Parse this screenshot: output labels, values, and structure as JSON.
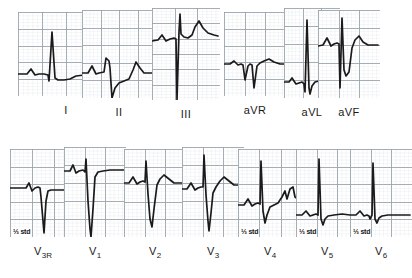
{
  "figure": {
    "name": "12-lead-electrocardiogram",
    "background_color": "#ffffff",
    "grid_color": "#9aa3ab",
    "grid_minor_color": "#c9d0d6",
    "trace_color": "#1a1a1a",
    "width": 382,
    "height": 278
  },
  "rows": [
    {
      "name": "limb-leads",
      "leads": [
        "I",
        "II",
        "III",
        "aVR",
        "aVL",
        "aVF"
      ]
    },
    {
      "name": "precordial-leads",
      "leads": [
        "V3R",
        "V1",
        "V2",
        "V3",
        "V4",
        "V5",
        "V6"
      ]
    }
  ],
  "leads": [
    {
      "id": "I",
      "label": "I",
      "label_sub": "",
      "row": 0,
      "x": 18,
      "y": 12,
      "w": 96,
      "h": 84,
      "grid_cols": 4,
      "grid_rows": 5,
      "std_note": "",
      "trace": "M0,62 L9,62 L13,57 L17,63 L21,62 L26,62 L30,63 L31,69 L34,20 L37,66 L40,68 L46,68 L52,67 L58,64 L66,63 L78,63 L94,63"
    },
    {
      "id": "II",
      "label": "II",
      "label_sub": "",
      "row": 0,
      "x": 82,
      "y": 10,
      "w": 74,
      "h": 88,
      "grid_cols": 4,
      "grid_rows": 5,
      "std_note": "",
      "trace": "M0,63 L6,63 L10,56 L14,64 L17,63 L22,62 L24,48 L27,51 L28,58 L30,88 L33,78 L37,73 L42,71 L47,69 L51,60 L54,52 L58,58 L62,63 L70,63"
    },
    {
      "id": "III",
      "label": "III",
      "label_sub": "",
      "row": 0,
      "x": 152,
      "y": 8,
      "w": 68,
      "h": 92,
      "grid_cols": 3,
      "grid_rows": 6,
      "std_note": "",
      "trace": "M0,33 L6,32 L10,27 L14,33 L18,31 L22,30 L24,31 L25,92 L27,24 L28,6 L29,26 L32,29 L36,30 L40,27 L43,19 L47,13 L51,20 L56,25 L62,27 L66,28"
    },
    {
      "id": "aVR",
      "label": "aVR",
      "label_sub": "",
      "row": 0,
      "x": 224,
      "y": 12,
      "w": 62,
      "h": 84,
      "grid_cols": 3,
      "grid_rows": 5,
      "std_note": "",
      "trace": "M0,52 L6,52 L10,49 L14,53 L17,52 L19,53 L21,68 L24,54 L26,52 L28,53 L30,76 L33,54 L36,51 L40,49 L45,47 L50,50 L56,52 L60,52"
    },
    {
      "id": "aVL",
      "label": "aVL",
      "label_sub": "",
      "row": 0,
      "x": 284,
      "y": 8,
      "w": 56,
      "h": 90,
      "grid_cols": 3,
      "grid_rows": 5,
      "std_note": "",
      "trace": "M0,74 L5,74 L8,70 L12,76 L15,75 L18,74 L20,76 L21,84 L23,12 L25,80 L26,86 L28,78 L31,74 L35,73 L41,72 L48,72 L54,72"
    },
    {
      "id": "aVF",
      "label": "aVF",
      "label_sub": "",
      "row": 0,
      "x": 318,
      "y": 10,
      "w": 62,
      "h": 88,
      "grid_cols": 3,
      "grid_rows": 5,
      "std_note": "",
      "trace": "M0,36 L5,35 L9,28 L13,36 L16,34 L19,33 L21,34 L22,78 L24,8 L26,60 L28,66 L31,62 L34,38 L37,30 L41,26 L45,32 L50,35 L56,35 L60,35"
    },
    {
      "id": "V3R",
      "label": "V",
      "label_sub": "3R",
      "row": 1,
      "x": 10,
      "y": 10,
      "w": 66,
      "h": 88,
      "grid_cols": 3,
      "grid_rows": 5,
      "std_note": "⅓ std",
      "trace": "M0,39 L10,39 L16,39 L19,34 L22,42 L25,39 L28,38 L30,39 L31,48 L34,84 L36,52 L38,42 L41,41 L46,41 L54,41 L64,41"
    },
    {
      "id": "V1",
      "label": "V",
      "label_sub": "1",
      "row": 1,
      "x": 64,
      "y": 8,
      "w": 62,
      "h": 90,
      "grid_cols": 3,
      "grid_rows": 5,
      "std_note": "",
      "trace": "M0,24 L6,24 L9,18 L12,26 L15,24 L19,23 L21,25 L22,12 L24,54 L26,82 L27,90 L29,62 L31,30 L34,25 L39,24 L46,23 L54,23 L60,23"
    },
    {
      "id": "V2",
      "label": "V",
      "label_sub": "2",
      "row": 1,
      "x": 124,
      "y": 10,
      "w": 62,
      "h": 88,
      "grid_cols": 3,
      "grid_rows": 5,
      "std_note": "",
      "trace": "M0,34 L5,34 L9,28 L13,35 L16,33 L19,32 L21,33 L22,12 L24,45 L26,70 L28,78 L30,60 L33,36 L36,30 L40,26 L45,30 L50,34 L56,34 L60,34"
    },
    {
      "id": "V3",
      "label": "V",
      "label_sub": "3",
      "row": 1,
      "x": 182,
      "y": 8,
      "w": 62,
      "h": 90,
      "grid_cols": 3,
      "grid_rows": 5,
      "std_note": "",
      "trace": "M0,42 L5,42 L9,36 L13,43 L16,41 L19,40 L21,40 L22,8 L24,48 L26,74 L27,84 L29,66 L31,46 L34,40 L38,34 L42,30 L47,34 L52,38 L58,38 L60,38"
    },
    {
      "id": "V4",
      "label": "V",
      "label_sub": "4",
      "row": 1,
      "x": 238,
      "y": 10,
      "w": 64,
      "h": 88,
      "grid_cols": 3,
      "grid_rows": 5,
      "std_note": "⅓ std",
      "trace": "M0,56 L6,56 L10,50 L14,57 L17,55 L20,54 L22,55 L23,12 L25,62 L27,74 L29,66 L32,58 L36,56 L40,54 L44,48 L47,42 L49,50 L52,40 L55,38 L57,48 L60,50 L63,50"
    },
    {
      "id": "V5",
      "label": "V",
      "label_sub": "5",
      "row": 1,
      "x": 296,
      "y": 10,
      "w": 62,
      "h": 88,
      "grid_cols": 3,
      "grid_rows": 5,
      "std_note": "⅓ std",
      "trace": "M0,66 L6,66 L10,62 L14,67 L17,66 L20,65 L22,66 L23,10 L25,70 L27,76 L29,70 L32,67 L38,66 L46,65 L54,66 L60,66"
    },
    {
      "id": "V6",
      "label": "V",
      "label_sub": "6",
      "row": 1,
      "x": 350,
      "y": 10,
      "w": 62,
      "h": 88,
      "grid_cols": 3,
      "grid_rows": 5,
      "std_note": "⅓ std",
      "trace": "M0,66 L6,66 L10,62 L14,67 L17,66 L19,67 L20,70 L22,66 L23,14 L25,70 L27,74 L29,69 L32,67 L38,66 L46,66 L54,66 L60,66"
    }
  ],
  "chart_data": {
    "type": "line",
    "xlabel": "",
    "ylabel": "",
    "grid": true,
    "legend": "none",
    "series": [
      {
        "name": "I",
        "calibration": "standard"
      },
      {
        "name": "II",
        "calibration": "standard"
      },
      {
        "name": "III",
        "calibration": "standard"
      },
      {
        "name": "aVR",
        "calibration": "standard"
      },
      {
        "name": "aVL",
        "calibration": "standard"
      },
      {
        "name": "aVF",
        "calibration": "standard"
      },
      {
        "name": "V3R",
        "calibration": "⅓ std"
      },
      {
        "name": "V1",
        "calibration": "standard"
      },
      {
        "name": "V2",
        "calibration": "standard"
      },
      {
        "name": "V3",
        "calibration": "standard"
      },
      {
        "name": "V4",
        "calibration": "⅓ std"
      },
      {
        "name": "V5",
        "calibration": "⅓ std"
      },
      {
        "name": "V6",
        "calibration": "⅓ std"
      }
    ]
  }
}
